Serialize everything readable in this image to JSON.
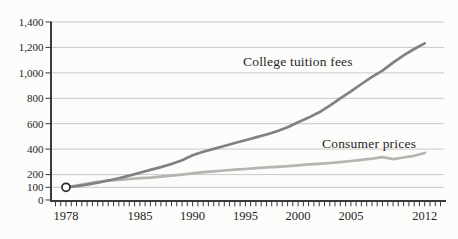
{
  "canvas": {
    "width": 458,
    "height": 239,
    "background": "#fcfcfa",
    "text_color": "#262626"
  },
  "chart_data": {
    "type": "line",
    "title": "",
    "xlabel": "",
    "ylabel": "",
    "index_note": "1978 = 100",
    "x": [
      1978,
      1979,
      1980,
      1981,
      1982,
      1983,
      1984,
      1985,
      1986,
      1987,
      1988,
      1989,
      1990,
      1991,
      1992,
      1993,
      1994,
      1995,
      1996,
      1997,
      1998,
      1999,
      2000,
      2001,
      2002,
      2003,
      2004,
      2005,
      2006,
      2007,
      2008,
      2009,
      2010,
      2011,
      2012
    ],
    "series": [
      {
        "name": "College tuition fees",
        "color": "#818181",
        "stroke_width": 2.7,
        "values": [
          100,
          109,
          121,
          136,
          153,
          171,
          192,
          215,
          237,
          259,
          283,
          313,
          352,
          380,
          402,
          425,
          448,
          470,
          492,
          515,
          540,
          572,
          612,
          648,
          690,
          742,
          800,
          855,
          912,
          968,
          1018,
          1080,
          1138,
          1188,
          1232
        ]
      },
      {
        "name": "Consumer prices",
        "color": "#b4b4b1",
        "stroke_width": 2.7,
        "values": [
          100,
          113,
          128,
          142,
          152,
          158,
          165,
          172,
          176,
          183,
          191,
          200,
          210,
          219,
          226,
          232,
          238,
          244,
          251,
          257,
          261,
          266,
          273,
          280,
          285,
          291,
          298,
          307,
          316,
          325,
          337,
          322,
          334,
          348,
          370
        ]
      }
    ],
    "start_marker": {
      "year": 1978,
      "value": 100
    },
    "y_axis": {
      "range": [
        0,
        1400
      ],
      "gridline_values": [
        100,
        200,
        400,
        600,
        800,
        1000,
        1200,
        1400
      ],
      "labels": [
        {
          "text": "0",
          "value": 0
        },
        {
          "text": "100",
          "value": 100
        },
        {
          "text": "200",
          "value": 200
        },
        {
          "text": "400",
          "value": 400
        },
        {
          "text": "600",
          "value": 600
        },
        {
          "text": "800",
          "value": 800
        },
        {
          "text": "1,000",
          "value": 1000
        },
        {
          "text": "1,200",
          "value": 1200
        },
        {
          "text": "1,400",
          "value": 1400
        }
      ],
      "gridline_color": "#c9c9c9",
      "axis_color": "#3a3a3a"
    },
    "x_axis": {
      "range_years": [
        1977,
        2013.5
      ],
      "minor_tick_step_years": 0.5,
      "labels": [
        {
          "text": "1978",
          "year": 1978
        },
        {
          "text": "1985",
          "year": 1985
        },
        {
          "text": "1990",
          "year": 1990
        },
        {
          "text": "1995",
          "year": 1995
        },
        {
          "text": "2000",
          "year": 2000
        },
        {
          "text": "2005",
          "year": 2005
        },
        {
          "text": "2012",
          "year": 2012
        }
      ],
      "axis_color": "#3a3a3a"
    },
    "annotations": [
      {
        "text": "College tuition fees",
        "left_px": 243,
        "top_px": 54
      },
      {
        "text": "Consumer prices",
        "left_px": 322,
        "top_px": 136
      }
    ],
    "legend_position": "inline-labels",
    "grid": true
  }
}
